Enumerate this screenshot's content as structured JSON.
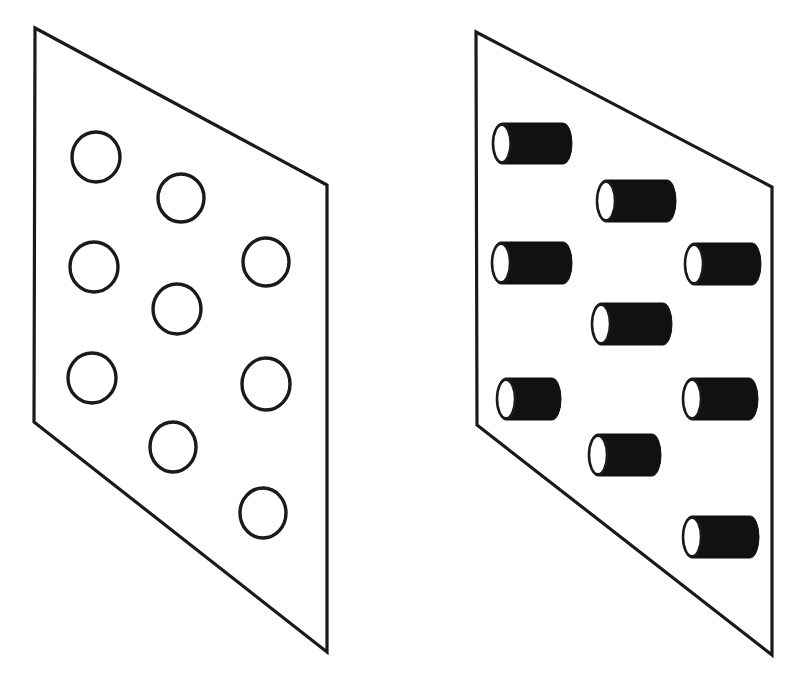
{
  "figure": {
    "background_color": "#ffffff",
    "stroke_color": "#1a1a1a",
    "fill_color": "#111111",
    "canvas": {
      "width": 798,
      "height": 683
    },
    "panels": [
      {
        "name": "left-panel",
        "label": "plane-with-circles",
        "description": "Tilted quadrilateral plane containing nine unfilled outlined circles",
        "outline_width": 3.2,
        "corners": [
          {
            "x": 35,
            "y": 28
          },
          {
            "x": 327,
            "y": 185
          },
          {
            "x": 327,
            "y": 652
          },
          {
            "x": 34,
            "y": 422
          }
        ],
        "shape_type": "circle",
        "shape_count": 9,
        "shapes": [
          {
            "name": "circle-1",
            "cx": 96,
            "cy": 157,
            "rx": 24,
            "ry": 25
          },
          {
            "name": "circle-2",
            "cx": 181,
            "cy": 198,
            "rx": 23,
            "ry": 24
          },
          {
            "name": "circle-3",
            "cx": 94,
            "cy": 267,
            "rx": 24,
            "ry": 25
          },
          {
            "name": "circle-4",
            "cx": 177,
            "cy": 309,
            "rx": 24,
            "ry": 25
          },
          {
            "name": "circle-5",
            "cx": 266,
            "cy": 262,
            "rx": 23,
            "ry": 24
          },
          {
            "name": "circle-6",
            "cx": 92,
            "cy": 378,
            "rx": 24,
            "ry": 25
          },
          {
            "name": "circle-7",
            "cx": 173,
            "cy": 447,
            "rx": 23,
            "ry": 25
          },
          {
            "name": "circle-8",
            "cx": 266,
            "cy": 384,
            "rx": 24,
            "ry": 26
          },
          {
            "name": "circle-9",
            "cx": 263,
            "cy": 513,
            "rx": 23,
            "ry": 25
          }
        ]
      },
      {
        "name": "right-panel",
        "label": "plane-with-cylinders",
        "description": "Tilted quadrilateral plane containing nine solid black cylinders each with a white elliptical end face on the left",
        "outline_width": 3.2,
        "corners": [
          {
            "x": 476,
            "y": 32
          },
          {
            "x": 772,
            "y": 187
          },
          {
            "x": 772,
            "y": 655
          },
          {
            "x": 477,
            "y": 425
          }
        ],
        "shape_type": "cylinder",
        "shape_count": 9,
        "shapes": [
          {
            "name": "cylinder-1",
            "x": 493,
            "y": 123,
            "w": 79,
            "h": 41
          },
          {
            "name": "cylinder-2",
            "x": 597,
            "y": 180,
            "w": 79,
            "h": 42
          },
          {
            "name": "cylinder-3",
            "x": 492,
            "y": 242,
            "w": 80,
            "h": 42
          },
          {
            "name": "cylinder-4",
            "x": 685,
            "y": 243,
            "w": 76,
            "h": 42
          },
          {
            "name": "cylinder-5",
            "x": 592,
            "y": 303,
            "w": 80,
            "h": 42
          },
          {
            "name": "cylinder-6",
            "x": 497,
            "y": 378,
            "w": 64,
            "h": 42
          },
          {
            "name": "cylinder-7",
            "x": 683,
            "y": 378,
            "w": 75,
            "h": 42
          },
          {
            "name": "cylinder-8",
            "x": 589,
            "y": 434,
            "w": 72,
            "h": 42
          },
          {
            "name": "cylinder-9",
            "x": 683,
            "y": 516,
            "w": 76,
            "h": 42
          }
        ]
      }
    ]
  }
}
